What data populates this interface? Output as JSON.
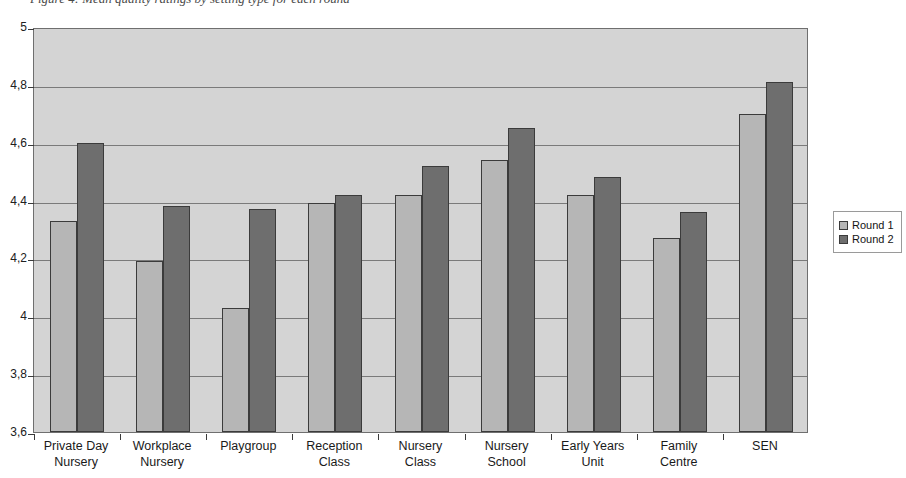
{
  "title_sliver": "Figure 4: Mean quality ratings by setting type for each round",
  "legend": {
    "position": "right",
    "entries": [
      {
        "label": "Round 1",
        "color": "#b6b6b6"
      },
      {
        "label": "Round 2",
        "color": "#6e6e6e"
      }
    ]
  },
  "axis": {
    "y_tick_labels": [
      "5",
      "4,8",
      "4,6",
      "4,4",
      "4,2",
      "4",
      "3,8",
      "3,6"
    ],
    "y_tick_values": [
      5,
      4.8,
      4.6,
      4.4,
      4.2,
      4,
      3.8,
      3.6
    ]
  },
  "chart_data": {
    "type": "bar",
    "title": "",
    "xlabel": "",
    "ylabel": "",
    "ylim": [
      3.6,
      5
    ],
    "ytick_labels": [
      "3,6",
      "3,8",
      "4",
      "4,2",
      "4,4",
      "4,6",
      "4,8",
      "5"
    ],
    "grid": true,
    "legend_position": "right",
    "categories": [
      "Private Day Nursery",
      "Workplace Nursery",
      "Playgroup",
      "Reception Class",
      "Nursery Class",
      "Nursery School",
      "Early Years Unit",
      "Family Centre",
      "SEN"
    ],
    "category_lines": [
      [
        "Private Day",
        "Nursery"
      ],
      [
        "Workplace",
        "Nursery"
      ],
      [
        "Playgroup",
        ""
      ],
      [
        "Reception",
        "Class"
      ],
      [
        "Nursery",
        "Class"
      ],
      [
        "Nursery",
        "School"
      ],
      [
        "Early Years",
        "Unit"
      ],
      [
        "Family",
        "Centre"
      ],
      [
        "SEN",
        ""
      ]
    ],
    "series": [
      {
        "name": "Round 1",
        "color": "#b6b6b6",
        "values": [
          4.33,
          4.19,
          4.03,
          4.39,
          4.42,
          4.54,
          4.42,
          4.27,
          4.7
        ]
      },
      {
        "name": "Round 2",
        "color": "#6e6e6e",
        "values": [
          4.6,
          4.38,
          4.37,
          4.42,
          4.52,
          4.65,
          4.48,
          4.36,
          4.81
        ]
      }
    ]
  }
}
